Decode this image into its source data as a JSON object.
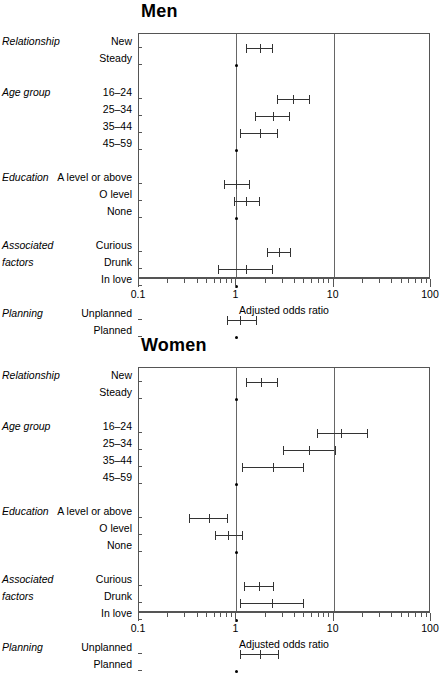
{
  "figure": {
    "axis_title": "Adjusted odds ratio",
    "axis_ticks": [
      "0.1",
      "1",
      "10",
      "100"
    ],
    "xlim": [
      0.1,
      100
    ],
    "reference_line": 1,
    "second_line": 10
  },
  "panels": [
    {
      "id": "men",
      "title": "Men",
      "axis_title": "Adjusted odds ratio",
      "groups": [
        {
          "name": "Relationship",
          "rows": [
            {
              "label": "New",
              "or": 1.75,
              "lcl": 1.25,
              "ucl": 2.35,
              "reference": false
            },
            {
              "label": "Steady",
              "or": 1.0,
              "lcl": null,
              "ucl": null,
              "reference": true
            }
          ]
        },
        {
          "name": "Age group",
          "rows": [
            {
              "label": "16–24",
              "or": 3.8,
              "lcl": 2.6,
              "ucl": 5.6,
              "reference": false
            },
            {
              "label": "25–34",
              "or": 2.4,
              "lcl": 1.55,
              "ucl": 3.5,
              "reference": false
            },
            {
              "label": "35–44",
              "or": 1.75,
              "lcl": 1.1,
              "ucl": 2.6,
              "reference": false
            },
            {
              "label": "45–59",
              "or": 1.0,
              "lcl": null,
              "ucl": null,
              "reference": true
            }
          ]
        },
        {
          "name": "Education",
          "rows": [
            {
              "label": "A level or above",
              "or": 1.0,
              "lcl": 0.75,
              "ucl": 1.35,
              "reference": false
            },
            {
              "label": "O level",
              "or": 1.25,
              "lcl": 0.95,
              "ucl": 1.7,
              "reference": false
            },
            {
              "label": "None",
              "or": 1.0,
              "lcl": null,
              "ucl": null,
              "reference": true
            }
          ]
        },
        {
          "name": "Associated factors",
          "name_line1": "Associated",
          "name_line2": "factors",
          "rows": [
            {
              "label": "Curious",
              "or": 2.75,
              "lcl": 2.05,
              "ucl": 3.6,
              "reference": false
            },
            {
              "label": "Drunk",
              "or": 1.25,
              "lcl": 0.65,
              "ucl": 2.35,
              "reference": false
            },
            {
              "label": "In love",
              "or": 1.0,
              "lcl": null,
              "ucl": null,
              "reference": true
            }
          ]
        },
        {
          "name": "Planning",
          "rows": [
            {
              "label": "Unplanned",
              "or": 1.1,
              "lcl": 0.8,
              "ucl": 1.6,
              "reference": false
            },
            {
              "label": "Planned",
              "or": 1.0,
              "lcl": null,
              "ucl": null,
              "reference": true
            }
          ]
        }
      ]
    },
    {
      "id": "women",
      "title": "Women",
      "axis_title": "Adjusted odds ratio",
      "groups": [
        {
          "name": "Relationship",
          "rows": [
            {
              "label": "New",
              "or": 1.8,
              "lcl": 1.25,
              "ucl": 2.6,
              "reference": false
            },
            {
              "label": "Steady",
              "or": 1.0,
              "lcl": null,
              "ucl": null,
              "reference": true
            }
          ]
        },
        {
          "name": "Age group",
          "rows": [
            {
              "label": "16–24",
              "or": 12.0,
              "lcl": 6.8,
              "ucl": 22.0,
              "reference": false
            },
            {
              "label": "25–34",
              "or": 5.6,
              "lcl": 3.0,
              "ucl": 10.2,
              "reference": false
            },
            {
              "label": "35–44",
              "or": 2.4,
              "lcl": 1.15,
              "ucl": 4.8,
              "reference": false
            },
            {
              "label": "45–59",
              "or": 1.0,
              "lcl": null,
              "ucl": null,
              "reference": true
            }
          ]
        },
        {
          "name": "Education",
          "rows": [
            {
              "label": "A level or above",
              "or": 0.52,
              "lcl": 0.33,
              "ucl": 0.8,
              "reference": false
            },
            {
              "label": "O level",
              "or": 0.82,
              "lcl": 0.6,
              "ucl": 1.15,
              "reference": false
            },
            {
              "label": "None",
              "or": 1.0,
              "lcl": null,
              "ucl": null,
              "reference": true
            }
          ]
        },
        {
          "name": "Associated factors",
          "name_line1": "Associated",
          "name_line2": "factors",
          "rows": [
            {
              "label": "Curious",
              "or": 1.7,
              "lcl": 1.2,
              "ucl": 2.4,
              "reference": false
            },
            {
              "label": "Drunk",
              "or": 2.3,
              "lcl": 1.1,
              "ucl": 4.8,
              "reference": false
            },
            {
              "label": "In love",
              "or": 1.0,
              "lcl": null,
              "ucl": null,
              "reference": true
            }
          ]
        },
        {
          "name": "Planning",
          "rows": [
            {
              "label": "Unplanned",
              "or": 1.75,
              "lcl": 1.1,
              "ucl": 2.7,
              "reference": false
            },
            {
              "label": "Planned",
              "or": 1.0,
              "lcl": null,
              "ucl": null,
              "reference": true
            }
          ]
        }
      ]
    }
  ],
  "chart_data": {
    "type": "scatter",
    "xlabel": "Adjusted odds ratio",
    "ylabel": "",
    "xscale": "log",
    "xlim": [
      0.1,
      100
    ],
    "xticks": [
      0.1,
      1,
      10,
      100
    ],
    "xticklabels": [
      "0.1",
      "1",
      "10",
      "100"
    ],
    "grid": false,
    "legend": "none",
    "reference_lines": [
      1,
      10
    ],
    "panels": [
      "Men",
      "Women"
    ],
    "categories": [
      "Relationship: New",
      "Relationship: Steady",
      "Age group: 16-24",
      "Age group: 25-34",
      "Age group: 35-44",
      "Age group: 45-59",
      "Education: A level or above",
      "Education: O level",
      "Education: None",
      "Associated factors: Curious",
      "Associated factors: Drunk",
      "Associated factors: In love",
      "Planning: Unplanned",
      "Planning: Planned"
    ],
    "series": [
      {
        "name": "Men",
        "values": [
          1.75,
          1.0,
          3.8,
          2.4,
          1.75,
          1.0,
          1.0,
          1.25,
          1.0,
          2.75,
          1.25,
          1.0,
          1.1,
          1.0
        ],
        "lower": [
          1.25,
          null,
          2.6,
          1.55,
          1.1,
          null,
          0.75,
          0.95,
          null,
          2.05,
          0.65,
          null,
          0.8,
          null
        ],
        "upper": [
          2.35,
          null,
          5.6,
          3.5,
          2.6,
          null,
          1.35,
          1.7,
          null,
          3.6,
          2.35,
          null,
          1.6,
          null
        ],
        "is_reference": [
          false,
          true,
          false,
          false,
          false,
          true,
          false,
          false,
          true,
          false,
          false,
          true,
          false,
          true
        ]
      },
      {
        "name": "Women",
        "values": [
          1.8,
          1.0,
          12.0,
          5.6,
          2.4,
          1.0,
          0.52,
          0.82,
          1.0,
          1.7,
          2.3,
          1.0,
          1.75,
          1.0
        ],
        "lower": [
          1.25,
          null,
          6.8,
          3.0,
          1.15,
          null,
          0.33,
          0.6,
          null,
          1.2,
          1.1,
          null,
          1.1,
          null
        ],
        "upper": [
          2.6,
          null,
          22.0,
          10.2,
          4.8,
          null,
          0.8,
          1.15,
          null,
          2.4,
          4.8,
          null,
          2.7,
          null
        ],
        "is_reference": [
          false,
          true,
          false,
          false,
          false,
          true,
          false,
          false,
          true,
          false,
          false,
          true,
          false,
          true
        ]
      }
    ]
  }
}
